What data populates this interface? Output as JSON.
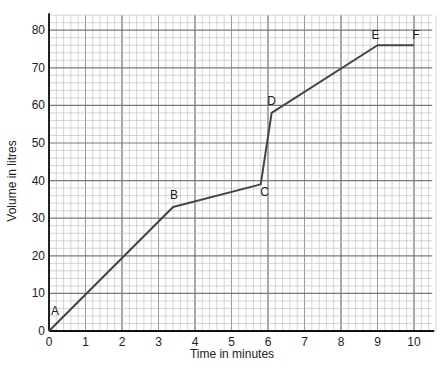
{
  "chart_data": {
    "type": "line",
    "title": "",
    "xlabel": "Time in minutes",
    "ylabel": "Volume in litres",
    "xlim": [
      0,
      10.5
    ],
    "ylim": [
      0,
      84
    ],
    "x_ticks": [
      0,
      1,
      2,
      3,
      4,
      5,
      6,
      7,
      8,
      9,
      10
    ],
    "y_ticks": [
      0,
      10,
      20,
      30,
      40,
      50,
      60,
      70,
      80
    ],
    "grid": true,
    "series": [
      {
        "name": "Volume",
        "points": [
          {
            "label": "A",
            "x": 0,
            "y": 0
          },
          {
            "label": "B",
            "x": 3.4,
            "y": 33
          },
          {
            "label": "C",
            "x": 5.8,
            "y": 39
          },
          {
            "label": "D",
            "x": 6.1,
            "y": 58
          },
          {
            "label": "E",
            "x": 9,
            "y": 76
          },
          {
            "label": "F",
            "x": 10,
            "y": 76
          }
        ]
      }
    ]
  },
  "colors": {
    "line": "#444444",
    "grid_minor": "#b8b8b8",
    "grid_major": "#7a7a7a",
    "axis": "#111111"
  }
}
